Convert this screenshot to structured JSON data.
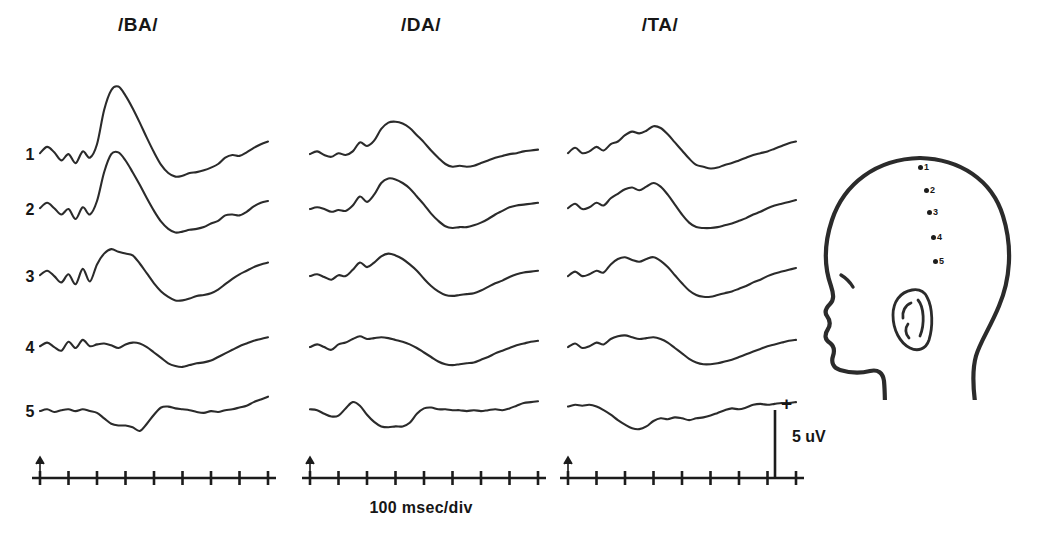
{
  "figure": {
    "kind": "erp-waveform-grid",
    "ink_color": "#2b2b2b",
    "background_color": "#ffffff"
  },
  "columns": [
    {
      "id": "ba",
      "label": "/BA/",
      "header_x": 138,
      "origin_x": 40,
      "width": 228
    },
    {
      "id": "da",
      "label": "/DA/",
      "header_x": 421,
      "origin_x": 310,
      "width": 228
    },
    {
      "id": "ta",
      "label": "/TA/",
      "header_x": 660,
      "origin_x": 568,
      "width": 228
    }
  ],
  "rows": [
    {
      "label": "1",
      "baseline_y": 155
    },
    {
      "label": "2",
      "baseline_y": 210
    },
    {
      "label": "3",
      "baseline_y": 277
    },
    {
      "label": "4",
      "baseline_y": 348
    },
    {
      "label": "5",
      "baseline_y": 412
    }
  ],
  "row_label_x": 30,
  "time_axis": {
    "y": 478,
    "tick_count": 9,
    "tick_half_height": 7,
    "onset_tick_index": 0,
    "onset_marker": "upward-arrow",
    "caption": "100 msec/div",
    "caption_x": 421,
    "caption_y": 510
  },
  "calibration": {
    "amplitude_label": "5 uV",
    "polarity_label": "+",
    "bar_x": 775,
    "bar_top_y": 410,
    "bar_bottom_y": 478,
    "label_x": 792,
    "label_y": 436,
    "polarity_x": 781,
    "polarity_y": 401
  },
  "head_diagram": {
    "name": "scalp-electrode-placement",
    "facing": "left",
    "electrodes": [
      {
        "label": "1",
        "cx": 922,
        "cy": 167
      },
      {
        "label": "2",
        "cx": 928,
        "cy": 190
      },
      {
        "label": "3",
        "cx": 931,
        "cy": 212
      },
      {
        "label": "4",
        "cx": 935,
        "cy": 237
      },
      {
        "label": "5",
        "cx": 937,
        "cy": 261
      }
    ]
  },
  "chart_data": {
    "type": "line",
    "title": "",
    "subtitle": "",
    "xlabel": "100 msec/div",
    "ylabel": "5 uV",
    "grid": false,
    "legend": "none",
    "annotations": [
      "Upward arrow on each time axis marks stimulus onset at the first division.",
      "Vertical calibration bar at right of /TA/ axis equals 5 uV; plus sign marks positive-up polarity.",
      "Head schematic at right shows five midline-to-lateral electrode sites numbered 1 through 5 descending from the vertex."
    ],
    "x_unit": "msec",
    "x_per_division": 100,
    "divisions": 8,
    "x_range_msec": [
      0,
      800
    ],
    "y_unit": "uV",
    "y_calibration": 5,
    "polarity": "positive up",
    "conditions": [
      "/BA/",
      "/DA/",
      "/TA/"
    ],
    "electrode_sites": [
      "1",
      "2",
      "3",
      "4",
      "5"
    ],
    "sample_x_msec": [
      0,
      25,
      50,
      75,
      100,
      125,
      150,
      175,
      200,
      225,
      250,
      275,
      300,
      325,
      350,
      375,
      400,
      425,
      450,
      475,
      500,
      525,
      550,
      575,
      600,
      625,
      650,
      675,
      700,
      725,
      750,
      775,
      800
    ],
    "series": [
      {
        "name": "/BA/ site 1",
        "condition": "/BA/",
        "site": "1",
        "values_uv": [
          0.2,
          0.9,
          0.3,
          -0.6,
          0.1,
          -0.9,
          0.4,
          -0.3,
          1.2,
          5.0,
          7.2,
          7.6,
          6.6,
          5.2,
          3.6,
          1.9,
          0.3,
          -1.1,
          -2.0,
          -2.4,
          -2.3,
          -2.0,
          -1.9,
          -1.7,
          -1.4,
          -1.0,
          -0.3,
          0.0,
          -0.1,
          0.3,
          0.8,
          1.2,
          1.5
        ]
      },
      {
        "name": "/BA/ site 2",
        "condition": "/BA/",
        "site": "2",
        "values_uv": [
          0.2,
          0.8,
          0.2,
          -0.5,
          0.1,
          -1.0,
          0.3,
          -0.5,
          1.0,
          4.2,
          6.2,
          6.4,
          5.5,
          4.2,
          2.8,
          1.3,
          -0.1,
          -1.3,
          -2.1,
          -2.5,
          -2.4,
          -2.2,
          -2.1,
          -1.9,
          -1.5,
          -1.2,
          -0.6,
          -0.5,
          -0.6,
          -0.2,
          0.4,
          0.8,
          1.0
        ]
      },
      {
        "name": "/BA/ site 3",
        "condition": "/BA/",
        "site": "3",
        "values_uv": [
          0.2,
          0.7,
          0.1,
          -0.6,
          0.3,
          -0.8,
          0.9,
          -0.5,
          1.4,
          2.6,
          3.1,
          2.8,
          2.6,
          2.4,
          1.5,
          0.4,
          -0.7,
          -1.6,
          -2.2,
          -2.6,
          -2.6,
          -2.4,
          -2.1,
          -2.0,
          -1.8,
          -1.4,
          -0.8,
          -0.2,
          0.3,
          0.7,
          1.1,
          1.4,
          1.6
        ]
      },
      {
        "name": "/BA/ site 4",
        "condition": "/BA/",
        "site": "4",
        "values_uv": [
          0.2,
          0.6,
          0.1,
          -0.3,
          0.7,
          0.0,
          0.9,
          0.2,
          0.4,
          0.5,
          0.3,
          0.0,
          0.4,
          0.6,
          0.5,
          0.1,
          -0.5,
          -1.1,
          -1.7,
          -2.0,
          -2.1,
          -1.9,
          -1.7,
          -1.6,
          -1.4,
          -1.0,
          -0.6,
          -0.2,
          0.2,
          0.5,
          0.8,
          1.0,
          1.2
        ]
      },
      {
        "name": "/BA/ site 5",
        "condition": "/BA/",
        "site": "5",
        "values_uv": [
          0.1,
          0.3,
          0.0,
          0.2,
          0.3,
          0.1,
          0.3,
          0.1,
          -0.1,
          -0.7,
          -1.3,
          -1.5,
          -1.5,
          -1.7,
          -2.1,
          -1.3,
          -0.3,
          0.5,
          0.6,
          0.4,
          0.3,
          0.2,
          0.0,
          -0.1,
          0.1,
          0.0,
          0.2,
          0.3,
          0.5,
          0.7,
          1.1,
          1.4,
          1.7
        ]
      },
      {
        "name": "/DA/ site 1",
        "condition": "/DA/",
        "site": "1",
        "values_uv": [
          0.1,
          0.4,
          0.0,
          -0.2,
          0.2,
          0.0,
          0.4,
          1.4,
          1.0,
          1.6,
          2.9,
          3.6,
          3.7,
          3.5,
          3.0,
          2.2,
          1.4,
          0.5,
          -0.3,
          -1.0,
          -1.3,
          -1.2,
          -1.3,
          -1.2,
          -0.9,
          -0.6,
          -0.3,
          -0.1,
          0.1,
          0.2,
          0.4,
          0.5,
          0.6
        ]
      },
      {
        "name": "/DA/ site 2",
        "condition": "/DA/",
        "site": "2",
        "values_uv": [
          0.1,
          0.3,
          0.1,
          -0.2,
          0.0,
          -0.1,
          0.5,
          1.5,
          0.9,
          1.7,
          3.0,
          3.5,
          3.4,
          3.0,
          2.4,
          1.5,
          0.6,
          -0.4,
          -1.2,
          -1.8,
          -2.0,
          -1.9,
          -1.9,
          -1.7,
          -1.4,
          -1.0,
          -0.5,
          -0.1,
          0.3,
          0.5,
          0.6,
          0.7,
          0.8
        ]
      },
      {
        "name": "/DA/ site 3",
        "condition": "/DA/",
        "site": "3",
        "values_uv": [
          0.1,
          0.3,
          0.0,
          -0.3,
          0.2,
          0.1,
          0.8,
          1.6,
          1.1,
          1.6,
          2.3,
          2.6,
          2.4,
          2.0,
          1.4,
          0.7,
          -0.2,
          -1.0,
          -1.6,
          -2.0,
          -2.1,
          -2.0,
          -1.9,
          -1.8,
          -1.5,
          -1.1,
          -0.7,
          -0.4,
          0.0,
          0.3,
          0.5,
          0.6,
          0.7
        ]
      },
      {
        "name": "/DA/ site 4",
        "condition": "/DA/",
        "site": "4",
        "values_uv": [
          0.1,
          0.4,
          0.1,
          -0.2,
          0.4,
          0.6,
          1.0,
          1.3,
          1.0,
          1.1,
          1.2,
          1.1,
          0.9,
          0.7,
          0.4,
          0.0,
          -0.5,
          -1.0,
          -1.5,
          -1.8,
          -1.9,
          -1.8,
          -1.7,
          -1.6,
          -1.3,
          -1.0,
          -0.6,
          -0.3,
          0.0,
          0.3,
          0.5,
          0.7,
          0.8
        ]
      },
      {
        "name": "/DA/ site 5",
        "condition": "/DA/",
        "site": "5",
        "values_uv": [
          0.3,
          0.2,
          -0.2,
          -0.5,
          -0.4,
          0.4,
          1.1,
          0.7,
          -0.3,
          -1.1,
          -1.6,
          -1.7,
          -1.6,
          -1.6,
          -1.2,
          -0.2,
          0.4,
          0.5,
          0.3,
          0.3,
          0.2,
          0.2,
          0.1,
          0.2,
          0.1,
          0.2,
          0.3,
          0.2,
          0.4,
          0.7,
          1.0,
          1.1,
          1.2
        ]
      },
      {
        "name": "/TA/ site 1",
        "condition": "/TA/",
        "site": "1",
        "values_uv": [
          0.2,
          0.8,
          0.2,
          0.4,
          0.9,
          0.5,
          1.2,
          1.5,
          2.2,
          2.6,
          2.4,
          2.7,
          3.2,
          3.0,
          2.3,
          1.4,
          0.5,
          -0.4,
          -1.1,
          -1.3,
          -1.5,
          -1.4,
          -1.1,
          -0.9,
          -0.6,
          -0.3,
          0.0,
          0.2,
          0.4,
          0.7,
          1.0,
          1.3,
          1.5
        ]
      },
      {
        "name": "/TA/ site 2",
        "condition": "/TA/",
        "site": "2",
        "values_uv": [
          0.2,
          0.7,
          0.1,
          0.3,
          0.8,
          0.5,
          1.3,
          1.8,
          2.3,
          2.5,
          2.2,
          2.6,
          3.0,
          2.6,
          1.7,
          0.6,
          -0.5,
          -1.4,
          -1.9,
          -2.0,
          -2.0,
          -1.9,
          -1.7,
          -1.5,
          -1.2,
          -0.9,
          -0.5,
          -0.2,
          0.2,
          0.5,
          0.7,
          0.9,
          1.1
        ]
      },
      {
        "name": "/TA/ site 3",
        "condition": "/TA/",
        "site": "3",
        "values_uv": [
          0.1,
          0.6,
          0.1,
          0.3,
          0.7,
          0.5,
          1.4,
          2.0,
          2.2,
          1.9,
          1.7,
          2.0,
          2.2,
          1.8,
          1.1,
          0.2,
          -0.7,
          -1.5,
          -2.0,
          -2.2,
          -2.2,
          -2.0,
          -1.8,
          -1.6,
          -1.3,
          -1.0,
          -0.6,
          -0.3,
          0.1,
          0.4,
          0.6,
          0.8,
          1.0
        ]
      },
      {
        "name": "/TA/ site 4",
        "condition": "/TA/",
        "site": "4",
        "values_uv": [
          0.1,
          0.5,
          0.0,
          0.2,
          0.6,
          0.4,
          1.0,
          1.3,
          1.4,
          1.2,
          1.0,
          1.1,
          1.2,
          1.0,
          0.6,
          0.0,
          -0.6,
          -1.2,
          -1.6,
          -1.8,
          -1.8,
          -1.7,
          -1.5,
          -1.3,
          -1.0,
          -0.7,
          -0.4,
          -0.1,
          0.2,
          0.4,
          0.6,
          0.8,
          0.9
        ]
      },
      {
        "name": "/TA/ site 5",
        "condition": "/TA/",
        "site": "5",
        "values_uv": [
          0.6,
          0.8,
          0.7,
          0.8,
          0.6,
          0.2,
          -0.3,
          -0.9,
          -1.4,
          -1.8,
          -1.9,
          -1.6,
          -1.0,
          -0.7,
          -0.8,
          -0.6,
          -0.7,
          -0.9,
          -0.7,
          -0.6,
          -0.4,
          -0.1,
          0.2,
          0.4,
          0.3,
          0.5,
          0.8,
          0.9,
          0.8,
          0.9,
          1.0,
          1.0,
          1.1
        ]
      }
    ]
  }
}
